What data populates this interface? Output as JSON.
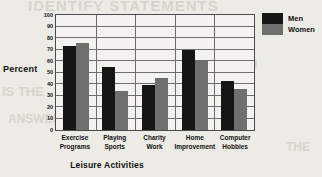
{
  "chart_data": {
    "type": "bar",
    "title": "",
    "xlabel": "Leisure Activities",
    "ylabel": "Percent",
    "categories": [
      "Exercise Programs",
      "Playing Sports",
      "Charity Work",
      "Home Improvement",
      "Computer Hobbies"
    ],
    "category_lines": [
      [
        "Exercise",
        "Programs"
      ],
      [
        "Playing",
        "Sports"
      ],
      [
        "Charity",
        "Work"
      ],
      [
        "Home",
        "Improvement"
      ],
      [
        "Computer",
        "Hobbies"
      ]
    ],
    "series": [
      {
        "name": "Men",
        "color": "#161616",
        "values": [
          73,
          55,
          39,
          70,
          43
        ]
      },
      {
        "name": "Women",
        "color": "#6f6f6f",
        "values": [
          76,
          34,
          45,
          60,
          36
        ]
      }
    ],
    "ylim": [
      0,
      100
    ],
    "yticks": [
      100,
      90,
      80,
      70,
      60,
      50,
      40,
      30,
      20,
      10,
      0
    ],
    "ytick_labels": [
      "100",
      "90",
      "80",
      "70",
      "60",
      "50",
      "40",
      "30",
      "20",
      "10",
      "0"
    ],
    "grid": true,
    "grid_axis": "y",
    "legend_position": "top-right",
    "legend": [
      "Men",
      "Women"
    ]
  },
  "legend": {
    "men_label": "Men",
    "women_label": "Women"
  },
  "axes": {
    "y_title": "Percent",
    "x_title": "Leisure Activities"
  },
  "ghost_text": {
    "line1": "IDENTIFY STATEMENTS",
    "line2": "VVOIVIEN",
    "line3": "IS THE",
    "line4": "MOST",
    "line5": "ANSWER",
    "line6": "THE"
  }
}
